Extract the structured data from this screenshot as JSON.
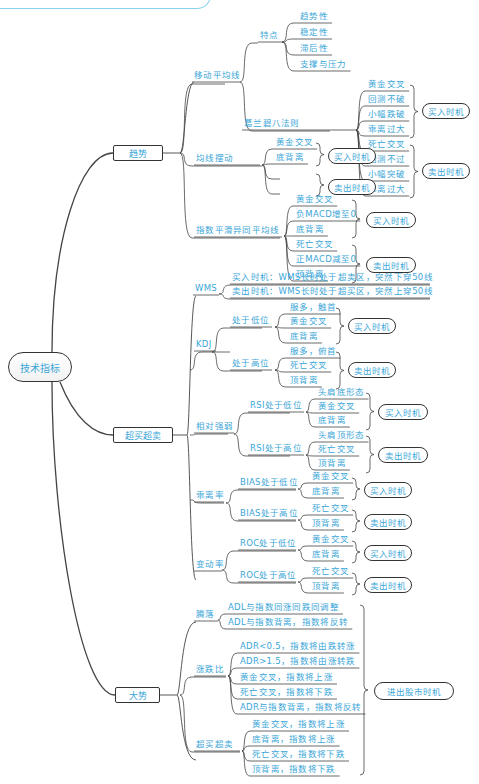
{
  "title_tab": "",
  "root": {
    "label": "技术指标"
  },
  "categories": [
    {
      "id": "trend",
      "label": "趋势"
    },
    {
      "id": "overbought",
      "label": "超买超卖"
    },
    {
      "id": "market",
      "label": "大势"
    }
  ],
  "trend": {
    "ma": {
      "label": "移动平均线",
      "features": {
        "label": "特点",
        "items": [
          "趋势性",
          "稳定性",
          "滞后性",
          "支撑与压力"
        ]
      },
      "granville": {
        "label": "葛兰碧八法则",
        "buy": [
          "黄金交叉",
          "回测不破",
          "小幅跌破",
          "乖离过大"
        ],
        "sell": [
          "死亡交叉",
          "回测不过",
          "小幅突破",
          "乖离过大"
        ]
      }
    },
    "ma_swing": {
      "label": "均线摆动",
      "buy": [
        "黄金交叉",
        "底背离"
      ],
      "sell": [
        "死亡交叉",
        "顶背离"
      ]
    },
    "macd": {
      "label": "指数平滑异同平均线",
      "buy": [
        "黄金交叉",
        "负MACD增至0",
        "底背离"
      ],
      "sell": [
        "死亡交叉",
        "正MACD减至0",
        "顶背离"
      ]
    }
  },
  "overbought": {
    "wms": {
      "label": "WMS",
      "items": [
        "买入时机：WMS长时处于超卖区，突然下穿50线",
        "卖出时机：WMS长时处于超买区，突然上穿50线"
      ]
    },
    "kdj": {
      "label": "KDJ",
      "low": {
        "label": "处于低位",
        "items": [
          "服多，触首",
          "黄金交叉",
          "底背离"
        ]
      },
      "high": {
        "label": "处于高位",
        "items": [
          "服多，俯首",
          "死亡交叉",
          "顶背离"
        ]
      }
    },
    "rsi": {
      "label": "相对强弱",
      "low": {
        "label": "RSI处于低位",
        "items": [
          "头肩底形态",
          "黄金交叉",
          "底背离"
        ]
      },
      "high": {
        "label": "RSI处于高位",
        "items": [
          "头肩顶形态",
          "死亡交叉",
          "顶背离"
        ]
      }
    },
    "bias": {
      "label": "乖离率",
      "low": {
        "label": "BIAS处于低位",
        "items": [
          "黄金交叉",
          "底背离"
        ]
      },
      "high": {
        "label": "BIAS处于高位",
        "items": [
          "死亡交叉",
          "顶背离"
        ]
      }
    },
    "roc": {
      "label": "变动率",
      "low": {
        "label": "ROC处于低位",
        "items": [
          "黄金交叉",
          "底背离"
        ]
      },
      "high": {
        "label": "ROC处于高位",
        "items": [
          "死亡交叉",
          "顶背离"
        ]
      }
    }
  },
  "market": {
    "adl": {
      "label": "腾落",
      "items": [
        "ADL与指数同涨同跌同调整",
        "ADL与指数背离，指数将反转"
      ]
    },
    "adr": {
      "label": "涨跌比",
      "items": [
        "ADR<0.5，指数将由跌转涨",
        "ADR>1.5，指数将由涨转跌",
        "黄金交叉，指数将上涨",
        "死亡交叉，指数将下跌",
        "ADR与指数背离，指数将反转"
      ]
    },
    "obos": {
      "label": "超买超卖",
      "items": [
        "黄金交叉，指数将上涨",
        "底背离，指数将上涨",
        "死亡交叉，指数将下跌",
        "顶背离，指数将下跌"
      ]
    },
    "outcome": "进出股市时机"
  },
  "outcomes": {
    "buy": "买入时机",
    "sell": "卖出时机"
  },
  "colors": {
    "text": "#3aa6d8",
    "line": "#333333",
    "accent": "#86d3ee"
  }
}
